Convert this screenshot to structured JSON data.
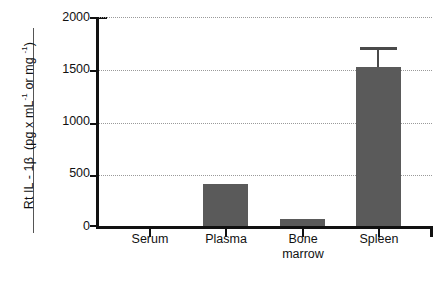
{
  "chart_data": {
    "type": "bar",
    "title": "",
    "subtitle": "",
    "xlabel": "",
    "ylabel": "Rt IL - 1β   (pg x mL⁻¹ or mg ⁻¹)",
    "ylabel_parts": {
      "analyte": "Rt IL - 1β",
      "units": "(pg x mL",
      "unit_sup_1": "-1",
      "units_mid": " or mg ",
      "unit_sup_2": "-1",
      "units_end": ")"
    },
    "categories": [
      "Serum",
      "Plasma",
      "Bone marrow",
      "Spleen"
    ],
    "category_lines": [
      [
        "Serum"
      ],
      [
        "Plasma"
      ],
      [
        "Bone",
        "marrow"
      ],
      [
        "Spleen"
      ]
    ],
    "values": [
      0,
      400,
      70,
      1520
    ],
    "errors": [
      0,
      0,
      0,
      190
    ],
    "error_upper": [
      0,
      0,
      0,
      1710
    ],
    "ylim": [
      0,
      2000
    ],
    "yticks": [
      0,
      500,
      1000,
      1500,
      2000
    ],
    "ytick_labels": [
      "0",
      "500",
      "1000",
      "1500",
      "2000"
    ],
    "grid": true,
    "grid_axis": "y",
    "grid_style": "dotted",
    "legend": false,
    "legend_position": "none",
    "bar_color": "#5a5a5a",
    "axis_color": "#111111",
    "grid_color": "#9a9a9a",
    "background_color": "#ffffff",
    "error_bar_color": "#4a4a4a"
  },
  "axis": {
    "y_title": "Rt IL - 1β",
    "y_units_open": "  (pg x mL",
    "y_sup_a": "-1",
    "y_units_mid": " or mg ",
    "y_sup_b": "-1",
    "y_units_close": ")",
    "ticks": {
      "t0": "0",
      "t500": "500",
      "t1000": "1000",
      "t1500": "1500",
      "t2000": "2000"
    }
  },
  "categories": {
    "serum": "Serum",
    "plasma": "Plasma",
    "bone": "Bone",
    "marrow": "marrow",
    "spleen": "Spleen"
  }
}
